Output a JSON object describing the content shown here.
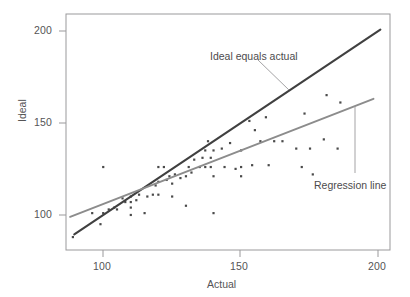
{
  "chart_data": {
    "type": "scatter",
    "title": "",
    "xlabel": "Actual",
    "ylabel": "Ideal",
    "xlim": [
      86.5,
      204
    ],
    "ylim": [
      81,
      209
    ],
    "xticks": [
      100,
      150,
      200
    ],
    "xtick_labels": [
      "100",
      "150",
      "200"
    ],
    "yticks": [
      100,
      150,
      200
    ],
    "ytick_labels": [
      "100",
      "150",
      "200"
    ],
    "grid": false,
    "legend": "none",
    "marker": "small-square-dot",
    "marker_color": "#4a4a4a",
    "points": [
      {
        "x": 89,
        "y": 88
      },
      {
        "x": 96,
        "y": 101
      },
      {
        "x": 99,
        "y": 95
      },
      {
        "x": 100,
        "y": 101
      },
      {
        "x": 100,
        "y": 126
      },
      {
        "x": 102,
        "y": 103
      },
      {
        "x": 104,
        "y": 104
      },
      {
        "x": 105,
        "y": 103
      },
      {
        "x": 107,
        "y": 109
      },
      {
        "x": 108,
        "y": 107
      },
      {
        "x": 110,
        "y": 100
      },
      {
        "x": 110,
        "y": 104
      },
      {
        "x": 110,
        "y": 107
      },
      {
        "x": 110,
        "y": 110
      },
      {
        "x": 112,
        "y": 108
      },
      {
        "x": 113,
        "y": 111
      },
      {
        "x": 115,
        "y": 101
      },
      {
        "x": 116,
        "y": 110
      },
      {
        "x": 118,
        "y": 111
      },
      {
        "x": 119,
        "y": 116
      },
      {
        "x": 120,
        "y": 111
      },
      {
        "x": 120,
        "y": 118
      },
      {
        "x": 120,
        "y": 126
      },
      {
        "x": 122,
        "y": 126
      },
      {
        "x": 123,
        "y": 119
      },
      {
        "x": 124,
        "y": 121
      },
      {
        "x": 125,
        "y": 110
      },
      {
        "x": 125,
        "y": 117
      },
      {
        "x": 126,
        "y": 122
      },
      {
        "x": 128,
        "y": 120
      },
      {
        "x": 130,
        "y": 105
      },
      {
        "x": 130,
        "y": 121
      },
      {
        "x": 131,
        "y": 126
      },
      {
        "x": 132,
        "y": 123
      },
      {
        "x": 133,
        "y": 130
      },
      {
        "x": 135,
        "y": 126
      },
      {
        "x": 136,
        "y": 131
      },
      {
        "x": 137,
        "y": 126
      },
      {
        "x": 137,
        "y": 135
      },
      {
        "x": 138,
        "y": 140
      },
      {
        "x": 139,
        "y": 126
      },
      {
        "x": 139,
        "y": 131
      },
      {
        "x": 140,
        "y": 101
      },
      {
        "x": 140,
        "y": 121
      },
      {
        "x": 140,
        "y": 135
      },
      {
        "x": 143,
        "y": 136
      },
      {
        "x": 144,
        "y": 126
      },
      {
        "x": 146,
        "y": 139
      },
      {
        "x": 148,
        "y": 125
      },
      {
        "x": 150,
        "y": 121
      },
      {
        "x": 150,
        "y": 126
      },
      {
        "x": 150,
        "y": 135
      },
      {
        "x": 153,
        "y": 151
      },
      {
        "x": 154,
        "y": 127
      },
      {
        "x": 155,
        "y": 146
      },
      {
        "x": 157,
        "y": 140
      },
      {
        "x": 159,
        "y": 153
      },
      {
        "x": 160,
        "y": 127
      },
      {
        "x": 162,
        "y": 140
      },
      {
        "x": 165,
        "y": 140
      },
      {
        "x": 170,
        "y": 136
      },
      {
        "x": 172,
        "y": 126
      },
      {
        "x": 173,
        "y": 155
      },
      {
        "x": 175,
        "y": 136
      },
      {
        "x": 176,
        "y": 122
      },
      {
        "x": 180,
        "y": 141
      },
      {
        "x": 181,
        "y": 165
      },
      {
        "x": 185,
        "y": 136
      },
      {
        "x": 186,
        "y": 161
      }
    ],
    "lines": [
      {
        "name": "Ideal equals actual",
        "color": "#404040",
        "width": 2.1,
        "x0": 89.5,
        "y0": 89.5,
        "x1": 200.5,
        "y1": 200.5
      },
      {
        "name": "Regression line",
        "color": "#8c8c8c",
        "width": 2.0,
        "x0": 88,
        "y0": 99,
        "x1": 198,
        "y1": 163
      }
    ],
    "annotations": [
      {
        "name": "ideal-equals-actual",
        "text": "Ideal equals actual",
        "text_x": 210,
        "text_y": 50,
        "leader": {
          "x0": 258,
          "y0": 60,
          "x1": 289,
          "y1": 90
        }
      },
      {
        "name": "regression-line",
        "text": "Regression line",
        "text_x": 314,
        "text_y": 179,
        "leader": {
          "x0": 355,
          "y0": 106,
          "x1": 355,
          "y1": 173
        }
      }
    ]
  },
  "axes": {
    "frame_color": "#9a999b",
    "tick_color": "#9a999b",
    "label_color": "#555456"
  }
}
